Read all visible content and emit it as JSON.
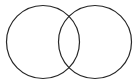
{
  "figure": {
    "name": "two-overlapping-circles",
    "type": "venn-diagram",
    "title": "",
    "width": 138,
    "height": 84,
    "background_color": "#ffffff",
    "stroke_color": "#272727",
    "stroke_width": 1.2,
    "fill_color": "#ffffff",
    "fill_opacity": 0
  },
  "shapes": [
    {
      "id": "left-circle",
      "label": "",
      "cx": 43,
      "cy": 42,
      "r": 36.5,
      "stroke_color": "#272727",
      "stroke_width": 1.2,
      "fill_color": "#ffffff"
    },
    {
      "id": "right-circle",
      "label": "",
      "cx": 95,
      "cy": 42,
      "r": 36.5,
      "stroke_color": "#272727",
      "stroke_width": 1.2,
      "fill_color": "#ffffff"
    }
  ],
  "regions": {
    "left_only_label": "",
    "right_only_label": "",
    "intersection_label": ""
  },
  "intersection_points": [
    {
      "x": 69,
      "y": 9
    },
    {
      "x": 69,
      "y": 75
    }
  ],
  "labels": []
}
